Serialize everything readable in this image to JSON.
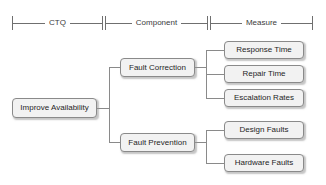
{
  "diagram": {
    "type": "ctq-tree",
    "colors": {
      "node_fill": "#f2f2f2",
      "node_border": "#8a8a8a",
      "connector": "#8a8a8a",
      "text": "#1f1f1f",
      "scale": "#6f6f6f",
      "background": "#ffffff"
    },
    "scale_bar": [
      {
        "label": "CTQ",
        "x": 12,
        "width": 91
      },
      {
        "label": "Component",
        "x": 105,
        "width": 103
      },
      {
        "label": "Measure",
        "x": 210,
        "width": 103
      }
    ],
    "levels": {
      "ctq": {
        "label": "CTQ",
        "nodes": [
          {
            "label": "Improve Availability",
            "x": 12,
            "y": 98,
            "w": 85,
            "h": 20
          }
        ]
      },
      "component": {
        "label": "Component",
        "nodes": [
          {
            "label": "Fault Correction",
            "x": 120,
            "y": 58,
            "w": 75,
            "h": 19
          },
          {
            "label": "Fault Prevention",
            "x": 120,
            "y": 133,
            "w": 75,
            "h": 19
          }
        ]
      },
      "measure": {
        "label": "Measure",
        "nodes": [
          {
            "label": "Response Time",
            "x": 224,
            "y": 41,
            "w": 80,
            "h": 18
          },
          {
            "label": "Repair Time",
            "x": 224,
            "y": 65,
            "w": 80,
            "h": 18
          },
          {
            "label": "Escalation Rates",
            "x": 224,
            "y": 89,
            "w": 80,
            "h": 18
          },
          {
            "label": "Design Faults",
            "x": 224,
            "y": 121,
            "w": 80,
            "h": 18
          },
          {
            "label": "Hardware Faults",
            "x": 224,
            "y": 154,
            "w": 80,
            "h": 18
          }
        ]
      }
    },
    "edges": [
      {
        "from": "Improve Availability",
        "to": "Fault Correction"
      },
      {
        "from": "Improve Availability",
        "to": "Fault Prevention"
      },
      {
        "from": "Fault Correction",
        "to": "Response Time"
      },
      {
        "from": "Fault Correction",
        "to": "Repair Time"
      },
      {
        "from": "Fault Correction",
        "to": "Escalation Rates"
      },
      {
        "from": "Fault Prevention",
        "to": "Design Faults"
      },
      {
        "from": "Fault Prevention",
        "to": "Hardware Faults"
      }
    ]
  }
}
